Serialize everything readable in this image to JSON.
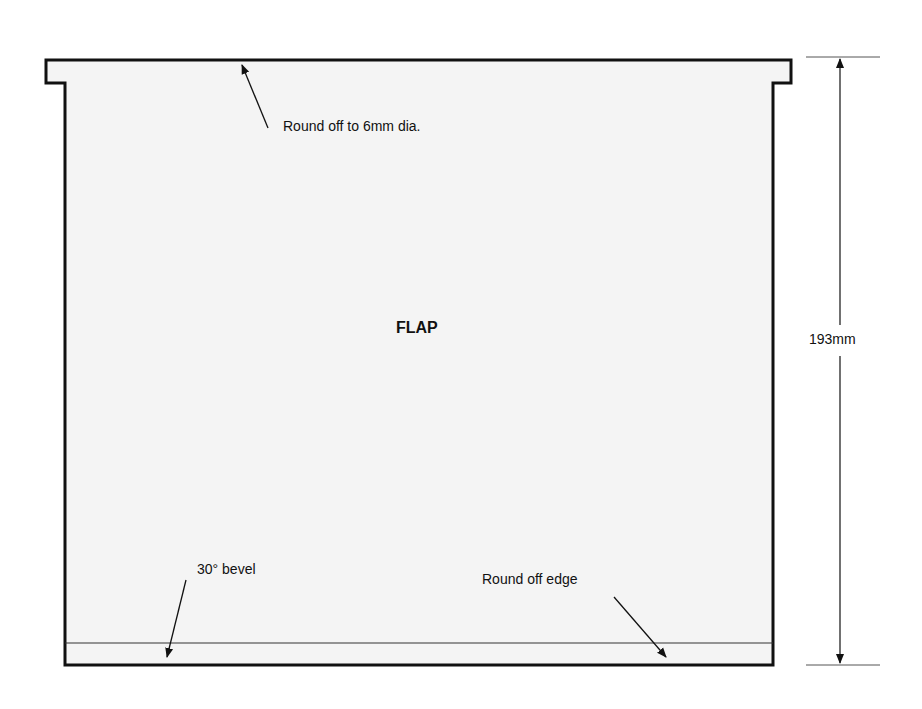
{
  "diagram": {
    "part_label": "FLAP",
    "annotations": {
      "top": "Round off to 6mm dia.",
      "bevel": "30° bevel",
      "edge": "Round off edge"
    },
    "dimension": {
      "height": "193mm"
    },
    "colors": {
      "fill": "#f4f4f4",
      "stroke": "#111111"
    }
  }
}
